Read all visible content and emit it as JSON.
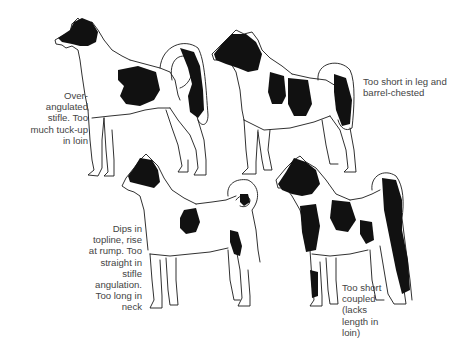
{
  "figure": {
    "background": "#ffffff",
    "ink_color": "#111111"
  },
  "panels": [
    {
      "id": "top-left",
      "caption_lines": [
        "Over-",
        "angulated",
        "stifle. Too",
        "much tuck-up",
        "in loin"
      ],
      "caption_align": "right"
    },
    {
      "id": "top-right",
      "caption_lines": [
        "Too short in leg and",
        "barrel-chested"
      ],
      "caption_align": "left"
    },
    {
      "id": "bottom-left",
      "caption_lines": [
        "Dips in",
        "topline, rise",
        "at rump. Too",
        "straight in",
        "stifle",
        "angulation.",
        "Too long in",
        "neck"
      ],
      "caption_align": "right"
    },
    {
      "id": "bottom-right",
      "caption_lines": [
        "Too short",
        "coupled",
        "(lacks",
        "length in",
        "loin)"
      ],
      "caption_align": "left"
    }
  ]
}
